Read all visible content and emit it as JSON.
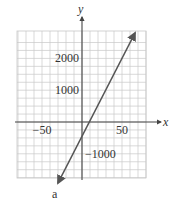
{
  "chart_data": {
    "type": "line",
    "title": "",
    "xlabel": "x",
    "ylabel": "y",
    "xlim": [
      -80,
      80
    ],
    "ylim": [
      -1800,
      2400
    ],
    "grid": true,
    "x_ticks": [
      -50,
      50
    ],
    "y_ticks": [
      2000,
      1000,
      -1000
    ],
    "x_tick_labels": [
      "−50",
      "50"
    ],
    "y_tick_labels": [
      "2000",
      "1000",
      "−1000"
    ],
    "series": [
      {
        "name": "line",
        "x": [
          -25,
          75
        ],
        "y": [
          -1800,
          2250
        ],
        "arrows": "both"
      }
    ],
    "footer_mark": "a"
  },
  "colors": {
    "grid": "#c8c8c8",
    "axis": "#444444",
    "line": "#555555",
    "text": "#333333"
  }
}
